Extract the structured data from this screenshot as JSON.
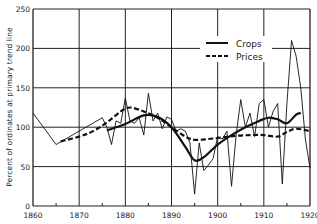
{
  "chart_data": {
    "type": "line",
    "title": "",
    "xlabel": "",
    "ylabel": "Percent of ordinates at primary trend line",
    "xlim": [
      1860,
      1920
    ],
    "ylim": [
      0,
      250
    ],
    "x_ticks": [
      1860,
      1870,
      1880,
      1890,
      1900,
      1910,
      1920
    ],
    "y_ticks": [
      0,
      50,
      100,
      150,
      200,
      250
    ],
    "grid": true,
    "legend_position": "upper right",
    "legend": [
      "Crops",
      "Prices"
    ],
    "series": [
      {
        "name": "Crops (annual)",
        "style": "thin-solid",
        "x": [
          1860,
          1865,
          1875,
          1876,
          1877,
          1878,
          1879,
          1880,
          1881,
          1882,
          1883,
          1884,
          1885,
          1886,
          1887,
          1888,
          1889,
          1890,
          1891,
          1892,
          1893,
          1894,
          1895,
          1896,
          1897,
          1898,
          1899,
          1900,
          1901,
          1902,
          1903,
          1904,
          1905,
          1906,
          1907,
          1908,
          1909,
          1910,
          1911,
          1912,
          1913,
          1914,
          1915,
          1916,
          1917,
          1918,
          1919,
          1920
        ],
        "values": [
          118,
          78,
          112,
          100,
          78,
          108,
          105,
          137,
          108,
          105,
          112,
          90,
          143,
          108,
          118,
          98,
          113,
          110,
          95,
          98,
          95,
          80,
          15,
          80,
          45,
          52,
          60,
          88,
          85,
          95,
          25,
          90,
          135,
          100,
          118,
          88,
          130,
          135,
          100,
          120,
          130,
          28,
          130,
          210,
          190,
          150,
          85,
          48
        ]
      },
      {
        "name": "Crops (trend)",
        "style": "thick-solid",
        "x": [
          1876,
          1880,
          1884,
          1887,
          1890,
          1893,
          1895,
          1897,
          1900,
          1903,
          1906,
          1909,
          1911,
          1913,
          1915,
          1917,
          1918
        ],
        "values": [
          96,
          104,
          115,
          113,
          100,
          75,
          58,
          62,
          78,
          90,
          100,
          108,
          112,
          110,
          105,
          116,
          118
        ]
      },
      {
        "name": "Prices",
        "style": "thick-dashed",
        "x": [
          1866,
          1870,
          1873,
          1876,
          1879,
          1881,
          1884,
          1887,
          1890,
          1893,
          1895,
          1898,
          1901,
          1904,
          1907,
          1910,
          1913,
          1915,
          1917,
          1920
        ],
        "values": [
          82,
          88,
          95,
          106,
          120,
          125,
          120,
          112,
          100,
          88,
          84,
          85,
          87,
          89,
          90,
          90,
          88,
          94,
          98,
          95
        ]
      }
    ]
  },
  "legend": {
    "crops_label": "Crops",
    "prices_label": "Prices"
  },
  "axes": {
    "ylabel": "Percent of ordinates at primary trend line",
    "x_tick_labels": [
      "1860",
      "1870",
      "1880",
      "1890",
      "1900",
      "1910",
      "1920"
    ],
    "y_tick_labels": [
      "0",
      "50",
      "100",
      "150",
      "200",
      "250"
    ]
  }
}
